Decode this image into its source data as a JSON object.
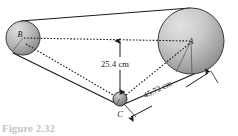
{
  "figure": {
    "type": "geometry-diagram",
    "background_color": "#ffffff",
    "line_color": "#1a1a1a",
    "pulley_fill_light": "#d8d8d8",
    "pulley_fill_dark": "#8a8a8a"
  },
  "pulleys": [
    {
      "id": "A",
      "label": "A",
      "role": "large-right-pulley",
      "center_x": 191,
      "center_y": 41,
      "radius": 33
    },
    {
      "id": "B",
      "label": "B",
      "role": "small-left-pulley",
      "center_x": 23,
      "center_y": 38,
      "radius": 17
    },
    {
      "id": "C",
      "label": "C",
      "role": "tiny-bottom-pulley",
      "center_x": 120,
      "center_y": 99,
      "radius": 7
    }
  ],
  "dimensions": [
    {
      "id": "height",
      "value": "25.4 cm",
      "orientation": "vertical",
      "from": "C",
      "to": "line-AB",
      "arrow": "double-headed"
    },
    {
      "id": "slant",
      "value": "45.72 cm",
      "orientation": "diagonal",
      "from": "C",
      "to": "A",
      "arrow": "double-headed"
    }
  ],
  "construction_lines": [
    {
      "id": "BA",
      "style": "dotted",
      "from": "B",
      "to": "A"
    },
    {
      "id": "BC",
      "style": "dotted",
      "from": "B",
      "to": "C"
    },
    {
      "id": "CA",
      "style": "dotted",
      "from": "C",
      "to": "A"
    }
  ],
  "belt": {
    "style": "solid",
    "segments": [
      "B-top to A-top",
      "B-bottom to C",
      "C to A-bottom"
    ]
  },
  "credit": {
    "text": "© Cengage Learning 2013"
  },
  "caption": {
    "text": "Figure 2.32"
  }
}
